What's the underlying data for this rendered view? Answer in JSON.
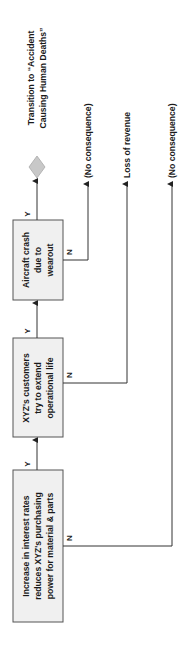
{
  "diagram": {
    "type": "event-tree",
    "orientation": "rotated-90-ccw",
    "colors": {
      "box_fill": "#f0f0f0",
      "box_stroke": "#555555",
      "line": "#333333",
      "diamond_fill": "#c8c8c8",
      "text": "#1a1a1a"
    },
    "nodes": [
      {
        "id": "event1",
        "lines": [
          "Increase in interest rates",
          "reduces XYZ's purchasing",
          "power for material & parts"
        ]
      },
      {
        "id": "event2",
        "lines": [
          "XYZ's customers",
          "try to extend",
          "operational life"
        ]
      },
      {
        "id": "event3",
        "lines": [
          "Aircraft crash",
          "due to",
          "wearout"
        ]
      }
    ],
    "transition": {
      "lines": [
        "Transition to “Accident",
        "Causing Human Deaths”"
      ]
    },
    "outcomes": [
      {
        "from": "event3",
        "branch": "N",
        "label": "(No consequence)"
      },
      {
        "from": "event2",
        "branch": "N",
        "label": "Loss of revenue"
      },
      {
        "from": "event1",
        "branch": "N",
        "label": "(No consequence)"
      }
    ],
    "branch_labels": {
      "yes": "Y",
      "no": "N"
    }
  }
}
